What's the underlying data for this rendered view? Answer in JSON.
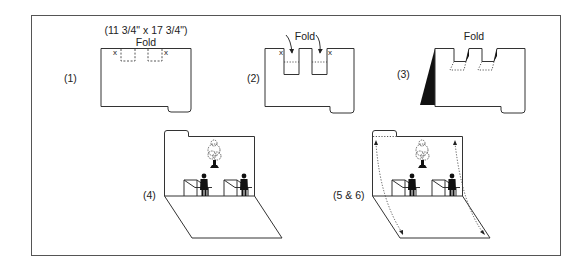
{
  "figure": {
    "colors": {
      "line": "#333333",
      "fill_black": "#111111",
      "background": "#ffffff",
      "frame": "#555555"
    }
  },
  "steps": [
    {
      "id": "1",
      "label": "(1)",
      "dimension": "(11 3/4\" x 17 3/4\")",
      "fold_label": "Fold",
      "marks": [
        "x",
        "x"
      ]
    },
    {
      "id": "2",
      "label": "(2)",
      "fold_label": "Fold",
      "marks": [
        "x",
        "x"
      ]
    },
    {
      "id": "3",
      "label": "(3)",
      "fold_label": "Fold"
    },
    {
      "id": "4",
      "label": "(4)"
    },
    {
      "id": "5-6",
      "label": "(5 & 6)"
    }
  ]
}
